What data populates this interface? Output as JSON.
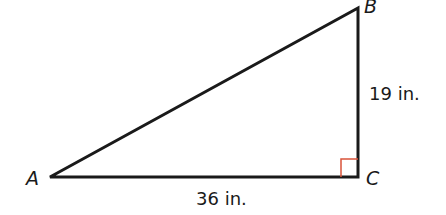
{
  "diagram": {
    "type": "right-triangle",
    "vertices": {
      "A": {
        "label": "A"
      },
      "B": {
        "label": "B"
      },
      "C": {
        "label": "C"
      }
    },
    "sides": {
      "AC": {
        "label": "36 in."
      },
      "BC": {
        "label": "19 in."
      }
    },
    "right_angle_at": "C",
    "colors": {
      "stroke": "#1a1a1a",
      "right_angle_marker": "#d9533a"
    }
  }
}
